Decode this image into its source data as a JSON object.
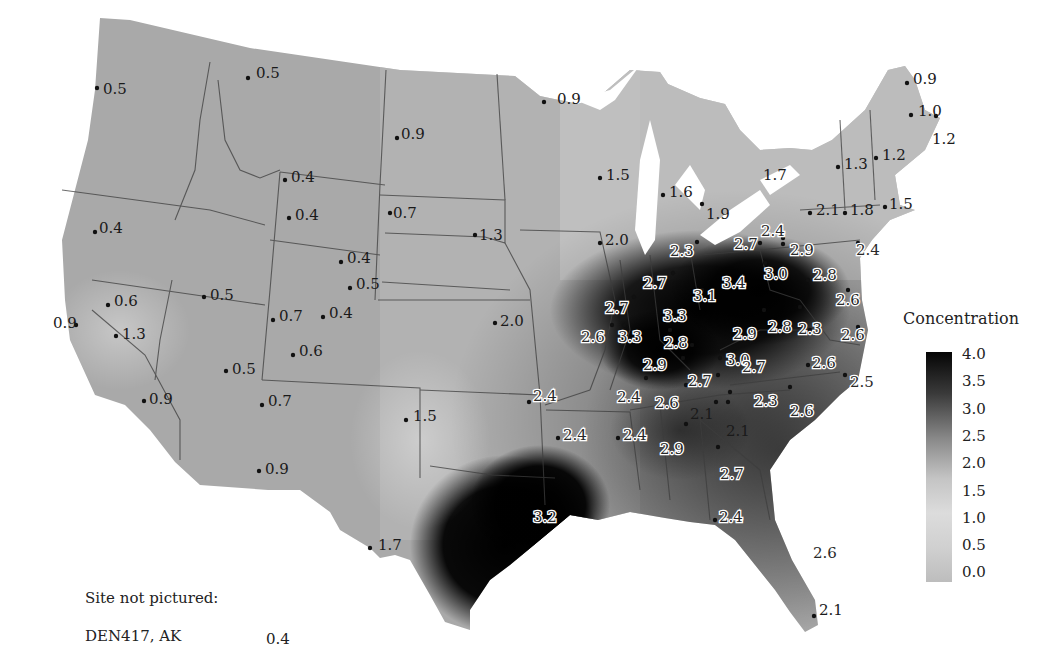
{
  "chart_data": {
    "type": "heatmap",
    "title": "",
    "subtitle": "Interpolated concentration map of contiguous United States with monitoring site values",
    "legend": {
      "title": "Concentration",
      "position": "right",
      "ticks": [
        "4.0",
        "3.5",
        "3.0",
        "2.5",
        "2.0",
        "1.5",
        "1.0",
        "0.5",
        "0.0"
      ],
      "range": [
        0.0,
        4.0
      ],
      "colormap": "grayscale (light = low, black = high)"
    },
    "sites": [
      {
        "label": "0.5",
        "x": 97,
        "y": 88,
        "lx": 103,
        "ly": 82
      },
      {
        "label": "0.5",
        "x": 248,
        "y": 78,
        "lx": 256,
        "ly": 66
      },
      {
        "label": "0.9",
        "x": 544,
        "y": 102,
        "lx": 557,
        "ly": 92
      },
      {
        "label": "0.9",
        "x": 397,
        "y": 138,
        "lx": 401,
        "ly": 127
      },
      {
        "label": "0.4",
        "x": 285,
        "y": 180,
        "lx": 291,
        "ly": 170
      },
      {
        "label": "0.4",
        "x": 289,
        "y": 218,
        "lx": 295,
        "ly": 208
      },
      {
        "label": "0.7",
        "x": 390,
        "y": 213,
        "lx": 393,
        "ly": 206
      },
      {
        "label": "0.4",
        "x": 95,
        "y": 232,
        "lx": 99,
        "ly": 221
      },
      {
        "label": "1.3",
        "x": 475,
        "y": 235,
        "lx": 479,
        "ly": 228
      },
      {
        "label": "0.4",
        "x": 341,
        "y": 262,
        "lx": 347,
        "ly": 251
      },
      {
        "label": "0.5",
        "x": 350,
        "y": 288,
        "lx": 356,
        "ly": 277
      },
      {
        "label": "0.6",
        "x": 108,
        "y": 305,
        "lx": 114,
        "ly": 294
      },
      {
        "label": "0.9",
        "x": 76,
        "y": 325,
        "lx": 53,
        "ly": 316
      },
      {
        "label": "1.3",
        "x": 116,
        "y": 336,
        "lx": 122,
        "ly": 327
      },
      {
        "label": "0.5",
        "x": 204,
        "y": 297,
        "lx": 210,
        "ly": 288
      },
      {
        "label": "0.7",
        "x": 273,
        "y": 320,
        "lx": 279,
        "ly": 309
      },
      {
        "label": "0.4",
        "x": 323,
        "y": 317,
        "lx": 329,
        "ly": 306
      },
      {
        "label": "0.6",
        "x": 293,
        "y": 355,
        "lx": 299,
        "ly": 344
      },
      {
        "label": "0.5",
        "x": 226,
        "y": 371,
        "lx": 232,
        "ly": 362
      },
      {
        "label": "0.7",
        "x": 262,
        "y": 405,
        "lx": 268,
        "ly": 394
      },
      {
        "label": "0.9",
        "x": 144,
        "y": 401,
        "lx": 149,
        "ly": 392
      },
      {
        "label": "0.9",
        "x": 259,
        "y": 471,
        "lx": 265,
        "ly": 462
      },
      {
        "label": "1.5",
        "x": 406,
        "y": 420,
        "lx": 413,
        "ly": 409
      },
      {
        "label": "1.7",
        "x": 370,
        "y": 548,
        "lx": 378,
        "ly": 538
      },
      {
        "label": "1.5",
        "x": 600,
        "y": 178,
        "lx": 606,
        "ly": 168
      },
      {
        "label": "1.6",
        "x": 663,
        "y": 195,
        "lx": 669,
        "ly": 185
      },
      {
        "label": "1.9",
        "x": 702,
        "y": 204,
        "lx": 706,
        "ly": 207
      },
      {
        "label": "1.7",
        "x": null,
        "y": null,
        "lx": 763,
        "ly": 168
      },
      {
        "label": "2.0",
        "x": 600,
        "y": 243,
        "lx": 605,
        "ly": 233
      },
      {
        "label": "2.0",
        "x": 495,
        "y": 323,
        "lx": 500,
        "ly": 314
      },
      {
        "label": "0.9",
        "x": 907,
        "y": 83,
        "lx": 913,
        "ly": 72
      },
      {
        "label": "1.0",
        "x": 911,
        "y": 115,
        "lx": 918,
        "ly": 104
      },
      {
        "label": "1.2",
        "x": 936,
        "y": 116,
        "lx": 932,
        "ly": 132
      },
      {
        "label": "1.2",
        "x": 876,
        "y": 158,
        "lx": 882,
        "ly": 148
      },
      {
        "label": "1.3",
        "x": 838,
        "y": 167,
        "lx": 844,
        "ly": 157
      },
      {
        "label": "2.1",
        "x": 810,
        "y": 213,
        "lx": 816,
        "ly": 203
      },
      {
        "label": "1.8",
        "x": 845,
        "y": 213,
        "lx": 850,
        "ly": 203
      },
      {
        "label": "1.5",
        "x": 885,
        "y": 207,
        "lx": 889,
        "ly": 197
      },
      {
        "label": "2.4",
        "x": 783,
        "y": 238,
        "lx": 761,
        "ly": 224
      },
      {
        "label": "2.7",
        "x": 760,
        "y": 243,
        "lx": 734,
        "ly": 237
      },
      {
        "label": "2.3",
        "x": 697,
        "y": 242,
        "lx": 670,
        "ly": 244
      },
      {
        "label": "2.9",
        "x": 783,
        "y": 244,
        "lx": 790,
        "ly": 243
      },
      {
        "label": "2.4",
        "x": 858,
        "y": 243,
        "lx": 856,
        "ly": 243
      },
      {
        "label": "2.7",
        "x": 673,
        "y": 273,
        "lx": 643,
        "ly": 276
      },
      {
        "label": "3.1",
        "x": 702,
        "y": 290,
        "lx": 693,
        "ly": 289
      },
      {
        "label": "3.4",
        "x": 726,
        "y": 277,
        "lx": 722,
        "ly": 276
      },
      {
        "label": "3.0",
        "x": 765,
        "y": 263,
        "lx": 764,
        "ly": 267
      },
      {
        "label": "2.8",
        "x": 808,
        "y": 280,
        "lx": 813,
        "ly": 268
      },
      {
        "label": "2.6",
        "x": 848,
        "y": 290,
        "lx": 836,
        "ly": 293
      },
      {
        "label": "2.7",
        "x": 634,
        "y": 297,
        "lx": 605,
        "ly": 301
      },
      {
        "label": "3.3",
        "x": 670,
        "y": 330,
        "lx": 663,
        "ly": 309
      },
      {
        "label": "2.6",
        "x": 612,
        "y": 325,
        "lx": 581,
        "ly": 330
      },
      {
        "label": "3.3",
        "x": 624,
        "y": 325,
        "lx": 618,
        "ly": 330
      },
      {
        "label": "2.8",
        "x": 692,
        "y": 345,
        "lx": 664,
        "ly": 336
      },
      {
        "label": "2.9",
        "x": 764,
        "y": 310,
        "lx": 733,
        "ly": 327
      },
      {
        "label": "2.8",
        "x": 800,
        "y": 307,
        "lx": 768,
        "ly": 320
      },
      {
        "label": "2.3",
        "x": 810,
        "y": 330,
        "lx": 798,
        "ly": 322
      },
      {
        "label": "2.6",
        "x": 858,
        "y": 327,
        "lx": 841,
        "ly": 328
      },
      {
        "label": "2.9",
        "x": 683,
        "y": 358,
        "lx": 643,
        "ly": 358
      },
      {
        "label": "3.0",
        "x": 720,
        "y": 358,
        "lx": 726,
        "ly": 353
      },
      {
        "label": "2.7",
        "x": 734,
        "y": 363,
        "lx": 742,
        "ly": 360
      },
      {
        "label": "2.6",
        "x": 808,
        "y": 365,
        "lx": 812,
        "ly": 356
      },
      {
        "label": "2.5",
        "x": 845,
        "y": 375,
        "lx": 850,
        "ly": 375
      },
      {
        "label": "2.7",
        "x": 718,
        "y": 375,
        "lx": 688,
        "ly": 374
      },
      {
        "label": "2.4",
        "x": 646,
        "y": 378,
        "lx": 617,
        "ly": 390
      },
      {
        "label": "2.6",
        "x": 686,
        "y": 385,
        "lx": 655,
        "ly": 396
      },
      {
        "label": "2.1",
        "x": 730,
        "y": 392,
        "lx": 690,
        "ly": 407
      },
      {
        "label": "2.3",
        "x": 716,
        "y": 402,
        "lx": 754,
        "ly": 394
      },
      {
        "label": "2.6",
        "x": 790,
        "y": 387,
        "lx": 790,
        "ly": 404
      },
      {
        "label": "2.1",
        "x": 728,
        "y": 402,
        "lx": 726,
        "ly": 424
      },
      {
        "label": "2.4",
        "x": 529,
        "y": 402,
        "lx": 533,
        "ly": 389
      },
      {
        "label": "2.4",
        "x": 558,
        "y": 438,
        "lx": 563,
        "ly": 428
      },
      {
        "label": "2.4",
        "x": 618,
        "y": 438,
        "lx": 623,
        "ly": 428
      },
      {
        "label": "2.9",
        "x": 686,
        "y": 424,
        "lx": 660,
        "ly": 442
      },
      {
        "label": "2.7",
        "x": 718,
        "y": 447,
        "lx": 720,
        "ly": 467
      },
      {
        "label": "3.2",
        "x": null,
        "y": null,
        "lx": 533,
        "ly": 510
      },
      {
        "label": "2.4",
        "x": 715,
        "y": 520,
        "lx": 719,
        "ly": 510
      },
      {
        "label": "2.6",
        "x": null,
        "y": null,
        "lx": 813,
        "ly": 546
      },
      {
        "label": "2.1",
        "x": 814,
        "y": 616,
        "lx": 819,
        "ly": 603
      }
    ],
    "hotspots": [
      {
        "name": "Ohio Valley",
        "peak": 3.4
      },
      {
        "name": "Texas Gulf Coast",
        "peak": 3.2
      }
    ]
  },
  "legend": {
    "title": "Concentration",
    "ticks": [
      "4.0",
      "3.5",
      "3.0",
      "2.5",
      "2.0",
      "1.5",
      "1.0",
      "0.5",
      "0.0"
    ]
  },
  "note": {
    "heading": "Site not pictured:",
    "site": "DEN417, AK",
    "value": "0.4"
  }
}
